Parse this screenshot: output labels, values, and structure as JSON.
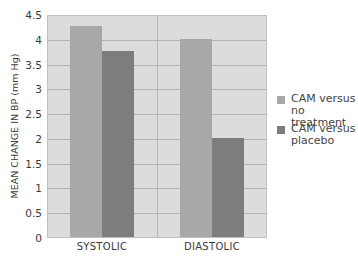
{
  "chart_data": {
    "type": "bar",
    "title": "",
    "xlabel": "",
    "ylabel": "MEAN CHANGE IN BP (mm Hg)",
    "categories": [
      "SYSTOLIC",
      "DIASTOLIC"
    ],
    "series": [
      {
        "name": "CAM versus no treatment",
        "color": "#a8a8a8",
        "values": [
          4.25,
          4.0
        ]
      },
      {
        "name": "CAM versus placebo",
        "color": "#7d7d7d",
        "values": [
          3.75,
          2.0
        ]
      }
    ],
    "ylim": [
      0,
      4.5
    ],
    "yticks": [
      "0",
      "0.5",
      "1",
      "1.5",
      "2",
      "2.5",
      "3",
      "3.5",
      "4",
      "4.5"
    ],
    "grid": true,
    "legend_position": "right",
    "background": "#dcdcdc"
  },
  "legend": {
    "items": [
      {
        "label": "CAM versus no treatment",
        "color": "#a8a8a8"
      },
      {
        "label": "CAM versus placebo",
        "color": "#7d7d7d"
      }
    ]
  }
}
